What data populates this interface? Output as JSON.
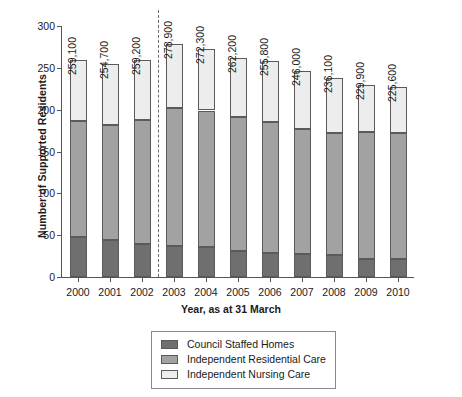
{
  "chart_data": {
    "type": "bar",
    "stacked": true,
    "title": "",
    "xlabel": "Year, as at 31 March",
    "ylabel": "Number of Supported Residents",
    "ylim": [
      0,
      300
    ],
    "yticks": [
      0,
      50,
      100,
      150,
      200,
      250,
      300
    ],
    "grid": false,
    "legend_position": "bottom",
    "categories": [
      "2000",
      "2001",
      "2002",
      "2003",
      "2004",
      "2005",
      "2006",
      "2007",
      "2008",
      "2009",
      "2010"
    ],
    "series": [
      {
        "name": "Council Staffed Homes",
        "color": "#6f6f6f",
        "values": [
          48,
          44,
          40,
          37,
          36,
          31,
          29,
          28,
          26,
          22,
          21
        ]
      },
      {
        "name": "Independent Residential Care",
        "color": "#a2a2a2",
        "values": [
          138,
          138,
          148,
          165,
          163,
          160,
          156,
          149,
          146,
          151,
          151
        ]
      },
      {
        "name": "Independent Nursing Care",
        "color": "#ededed",
        "values": [
          73,
          73,
          71,
          77,
          74,
          71,
          73,
          69,
          66,
          57,
          55
        ]
      }
    ],
    "totals": [
      259,
      255,
      259,
      279,
      273,
      262,
      258,
      246,
      238,
      230,
      227
    ],
    "bar_labels": [
      "259,100",
      "254,700",
      "259,200",
      "278,900",
      "272,300",
      "262,200",
      "255,800",
      "246,000",
      "236,100",
      "229,900",
      "225,600"
    ],
    "annotations": [
      {
        "type": "vertical-dashed-line",
        "between": [
          "2002",
          "2003"
        ]
      }
    ]
  },
  "axes": {
    "y_title": "Number of Supported Residents",
    "x_title": "Year, as at 31 March",
    "y_tick_labels": [
      "0",
      "50",
      "100",
      "150",
      "200",
      "250",
      "300"
    ],
    "x_tick_labels": [
      "2000",
      "2001",
      "2002",
      "2003",
      "2004",
      "2005",
      "2006",
      "2007",
      "2008",
      "2009",
      "2010"
    ]
  },
  "legend": {
    "items": [
      {
        "label": "Council Staffed Homes",
        "color": "#6f6f6f"
      },
      {
        "label": "Independent Residential Care",
        "color": "#a2a2a2"
      },
      {
        "label": "Independent Nursing Care",
        "color": "#ededed"
      }
    ]
  }
}
